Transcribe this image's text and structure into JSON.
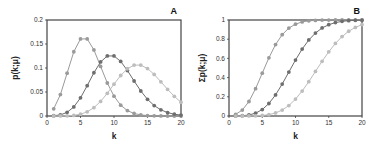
{
  "chart_data": [
    {
      "type": "line",
      "panel_label": "A",
      "title": "",
      "xlabel": "k",
      "ylabel": "p(k;μ)",
      "xlim": [
        0,
        20
      ],
      "ylim": [
        0,
        0.2
      ],
      "xticks": [
        "0",
        "5",
        "10",
        "15",
        "20"
      ],
      "yticks": [
        "0",
        "0.05",
        "0.1",
        "0.15",
        "0.2"
      ],
      "grid": false,
      "legend": "none",
      "x": [
        1,
        2,
        3,
        4,
        5,
        6,
        7,
        8,
        9,
        10,
        11,
        12,
        13,
        14,
        15,
        16,
        17,
        18,
        19,
        20
      ],
      "series": [
        {
          "name": "μ=6",
          "color": "#9a9a9a",
          "values": [
            0.0149,
            0.0446,
            0.0892,
            0.1339,
            0.1606,
            0.1606,
            0.1377,
            0.1033,
            0.0688,
            0.0413,
            0.0225,
            0.0113,
            0.0052,
            0.0022,
            0.0009,
            0.0003,
            0.0001,
            0.0,
            0.0,
            0.0
          ]
        },
        {
          "name": "μ=10",
          "color": "#6e6e6e",
          "values": [
            0.0005,
            0.0023,
            0.0076,
            0.0189,
            0.0378,
            0.0631,
            0.0901,
            0.1126,
            0.1251,
            0.1251,
            0.1137,
            0.0948,
            0.0729,
            0.0521,
            0.0347,
            0.0217,
            0.0128,
            0.0071,
            0.0037,
            0.0019
          ]
        },
        {
          "name": "μ=14",
          "color": "#bdbdbd",
          "values": [
            0.0,
            0.0001,
            0.0004,
            0.0013,
            0.0037,
            0.0087,
            0.0174,
            0.0304,
            0.0473,
            0.0663,
            0.0844,
            0.0984,
            0.106,
            0.106,
            0.0989,
            0.0866,
            0.0713,
            0.0554,
            0.0409,
            0.0286
          ]
        }
      ]
    },
    {
      "type": "line",
      "panel_label": "B",
      "title": "",
      "xlabel": "k",
      "ylabel": "Σp(k;μ)",
      "xlim": [
        0,
        20
      ],
      "ylim": [
        0,
        1
      ],
      "xticks": [
        "0",
        "5",
        "10",
        "15",
        "20"
      ],
      "yticks": [
        "0",
        "0.2",
        "0.4",
        "0.6",
        "0.8",
        "1"
      ],
      "grid": false,
      "legend": "none",
      "x": [
        1,
        2,
        3,
        4,
        5,
        6,
        7,
        8,
        9,
        10,
        11,
        12,
        13,
        14,
        15,
        16,
        17,
        18,
        19,
        20
      ],
      "series": [
        {
          "name": "μ=6",
          "color": "#9a9a9a",
          "values": [
            0.0174,
            0.062,
            0.151,
            0.285,
            0.446,
            0.606,
            0.744,
            0.847,
            0.916,
            0.957,
            0.98,
            0.991,
            0.996,
            0.999,
            0.9995,
            1,
            1,
            1,
            1,
            1
          ]
        },
        {
          "name": "μ=10",
          "color": "#6e6e6e",
          "values": [
            0.0005,
            0.0028,
            0.0103,
            0.0293,
            0.0671,
            0.13,
            0.22,
            0.333,
            0.458,
            0.583,
            0.697,
            0.792,
            0.864,
            0.917,
            0.951,
            0.973,
            0.986,
            0.993,
            0.997,
            0.998
          ]
        },
        {
          "name": "μ=14",
          "color": "#bdbdbd",
          "values": [
            0.0,
            0.0001,
            0.0005,
            0.0018,
            0.0055,
            0.0142,
            0.0316,
            0.0621,
            0.109,
            0.176,
            0.26,
            0.358,
            0.464,
            0.57,
            0.669,
            0.756,
            0.827,
            0.883,
            0.923,
            0.952
          ]
        }
      ]
    }
  ]
}
